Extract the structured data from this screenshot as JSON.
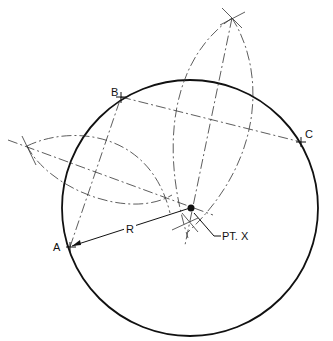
{
  "labels": {
    "point_a": "A",
    "point_b": "B",
    "point_c": "C",
    "radius": "R",
    "center": "PT. X"
  },
  "colors": {
    "stroke": "#111111",
    "construction": "#333333",
    "background": "#ffffff"
  }
}
